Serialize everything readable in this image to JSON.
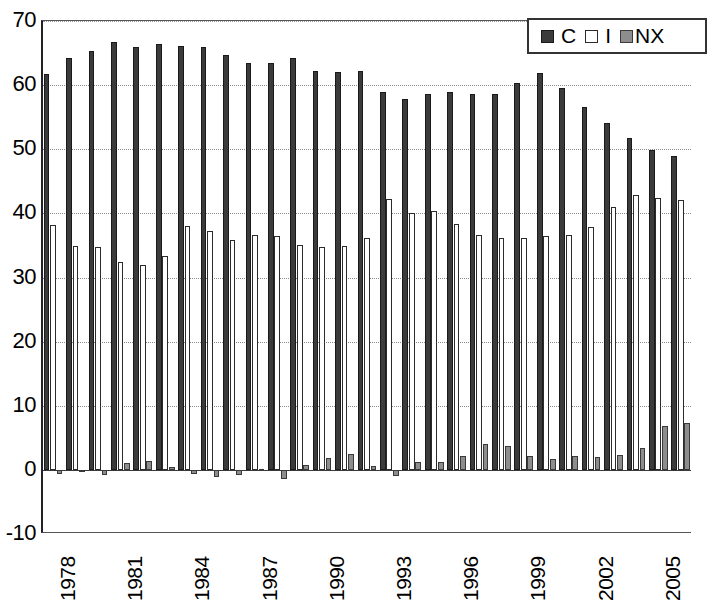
{
  "chart_data": {
    "type": "bar",
    "title": "",
    "subtitle": "",
    "xlabel": "",
    "ylabel": "",
    "ylim": [
      -10,
      70
    ],
    "ytick_values": [
      -10,
      0,
      10,
      20,
      30,
      40,
      50,
      60,
      70
    ],
    "ytick_labels": [
      "-10",
      "0",
      "10",
      "20",
      "30",
      "40",
      "50",
      "60",
      "70"
    ],
    "grid": true,
    "grid_axis": "y",
    "legend_position": "top-right",
    "legend": [
      "C",
      "I",
      "NX"
    ],
    "x_tick_interval": 3,
    "x_tick_labels": [
      "1978",
      "1981",
      "1984",
      "1987",
      "1990",
      "1993",
      "1996",
      "1999",
      "2002",
      "2005"
    ],
    "categories": [
      "1978",
      "1979",
      "1980",
      "1981",
      "1982",
      "1983",
      "1984",
      "1985",
      "1986",
      "1987",
      "1988",
      "1989",
      "1990",
      "1991",
      "1992",
      "1993",
      "1994",
      "1995",
      "1996",
      "1997",
      "1998",
      "1999",
      "2000",
      "2001",
      "2002",
      "2003",
      "2004",
      "2005",
      "2006"
    ],
    "series": [
      {
        "name": "C",
        "color": "#3b3b3b",
        "values": [
          61.8,
          64.3,
          65.3,
          66.8,
          65.9,
          66.4,
          66.1,
          66.0,
          64.7,
          63.4,
          63.4,
          64.2,
          62.2,
          62.1,
          62.2,
          58.9,
          57.9,
          58.6,
          58.9,
          58.6,
          58.6,
          60.4,
          61.9,
          59.5,
          56.6,
          54.1,
          51.8,
          49.9,
          48.9
        ]
      },
      {
        "name": "I",
        "color": "#ffffff",
        "values": [
          38.2,
          34.9,
          34.8,
          32.4,
          31.9,
          33.4,
          38.0,
          37.3,
          35.8,
          36.7,
          36.4,
          35.1,
          34.7,
          34.9,
          36.1,
          42.3,
          40.0,
          40.4,
          38.4,
          36.6,
          36.2,
          36.1,
          36.4,
          36.6,
          37.9,
          41.0,
          42.9,
          42.4,
          42.1
        ]
      },
      {
        "name": "NX",
        "color": "#8d8d8d",
        "values": [
          -0.6,
          -0.4,
          -0.8,
          1.0,
          1.4,
          0.4,
          -0.6,
          -1.1,
          -0.8,
          0.2,
          -1.4,
          0.8,
          1.8,
          2.5,
          0.6,
          -0.9,
          1.2,
          1.3,
          2.2,
          4.0,
          3.7,
          2.1,
          1.7,
          2.2,
          2.0,
          2.3,
          3.4,
          6.9,
          7.3
        ]
      }
    ]
  }
}
